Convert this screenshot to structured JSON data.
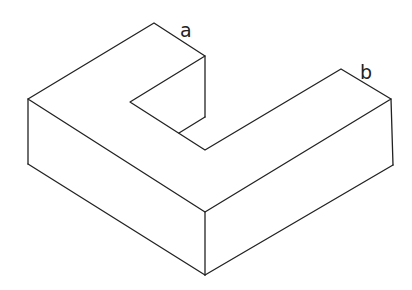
{
  "diagram": {
    "type": "isometric L-shaped block",
    "labels": [
      {
        "id": "a",
        "text": "a",
        "x": 180,
        "y": 37
      },
      {
        "id": "b",
        "text": "b",
        "x": 360,
        "y": 79
      }
    ],
    "colors": {
      "stroke": "#222222",
      "background": "#ffffff"
    }
  }
}
